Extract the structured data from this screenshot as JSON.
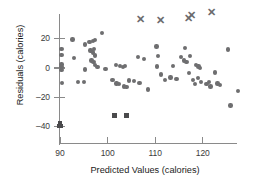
{
  "chart_data": {
    "type": "scatter",
    "title": "",
    "xlabel": "Predicted Values (calories)",
    "ylabel": "Residuals (calories)",
    "xlim": [
      87,
      129
    ],
    "ylim": [
      -44,
      40
    ],
    "xticks": [
      90,
      100,
      110,
      120
    ],
    "xtick_labels": [
      "90",
      "100",
      "110",
      "120"
    ],
    "yticks": [
      20,
      0,
      -20,
      -40
    ],
    "ytick_labels": [
      "20",
      "0",
      "–20",
      "–40"
    ],
    "grid": false,
    "legend": "none",
    "series": [
      {
        "name": "residuals",
        "marker": "circle",
        "color": "#6e6e70",
        "points": [
          [
            90.3,
            13.0
          ],
          [
            90.3,
            9.0
          ],
          [
            90.3,
            2.5
          ],
          [
            90.3,
            0.5
          ],
          [
            90.3,
            -1.5
          ],
          [
            90.4,
            -10.0
          ],
          [
            92.6,
            19.5
          ],
          [
            93.0,
            7.0
          ],
          [
            93.8,
            -9.5
          ],
          [
            95.3,
            16.0
          ],
          [
            96.2,
            17.5
          ],
          [
            96.9,
            18.5
          ],
          [
            97.3,
            19.0
          ],
          [
            96.4,
            12.0
          ],
          [
            96.9,
            10.5
          ],
          [
            97.2,
            13.0
          ],
          [
            97.4,
            8.5
          ],
          [
            96.6,
            5.0
          ],
          [
            97.0,
            4.0
          ],
          [
            97.3,
            2.0
          ],
          [
            97.9,
            0.5
          ],
          [
            98.8,
            24.0
          ],
          [
            95.2,
            -1.0
          ],
          [
            95.0,
            -9.5
          ],
          [
            101.8,
            2.0
          ],
          [
            102.6,
            1.5
          ],
          [
            103.2,
            0.5
          ],
          [
            103.6,
            1.5
          ],
          [
            101.9,
            -10.5
          ],
          [
            102.4,
            -11.0
          ],
          [
            103.4,
            -12.5
          ],
          [
            104.0,
            -13.0
          ],
          [
            104.5,
            -8.5
          ],
          [
            105.6,
            -9.0
          ],
          [
            106.7,
            -10.0
          ],
          [
            106.4,
            7.5
          ],
          [
            107.6,
            6.0
          ],
          [
            108.5,
            -14.5
          ],
          [
            110.3,
            14.5
          ],
          [
            110.6,
            8.0
          ],
          [
            110.4,
            1.0
          ],
          [
            111.2,
            -4.5
          ],
          [
            112.0,
            -8.0
          ],
          [
            113.2,
            -6.5
          ],
          [
            114.5,
            -7.5
          ],
          [
            115.4,
            7.5
          ],
          [
            116.2,
            13.5
          ],
          [
            116.0,
            5.0
          ],
          [
            116.6,
            4.0
          ],
          [
            117.3,
            8.0
          ],
          [
            117.1,
            -3.5
          ],
          [
            118.0,
            -8.0
          ],
          [
            118.3,
            -11.0
          ],
          [
            118.6,
            2.0
          ],
          [
            119.1,
            1.0
          ],
          [
            119.4,
            0.0
          ],
          [
            119.0,
            -7.0
          ],
          [
            119.6,
            -9.5
          ],
          [
            120.8,
            -11.0
          ],
          [
            121.3,
            -9.5
          ],
          [
            121.6,
            -12.5
          ],
          [
            122.6,
            -3.0
          ],
          [
            123.1,
            -10.5
          ],
          [
            123.6,
            -11.5
          ],
          [
            125.3,
            12.5
          ],
          [
            125.8,
            -25.5
          ],
          [
            127.4,
            -15.5
          ],
          [
            99.6,
            -0.5
          ],
          [
            101.0,
            -8.0
          ],
          [
            113.8,
            1.5
          ]
        ]
      },
      {
        "name": "influential-high-outliers",
        "marker": "x",
        "color": "#6b6b6d",
        "points": [
          [
            106.9,
            33.5
          ],
          [
            111.2,
            32.5
          ],
          [
            117.0,
            34.0
          ],
          [
            117.6,
            36.0
          ],
          [
            121.9,
            38.0
          ]
        ]
      },
      {
        "name": "low-outliers",
        "marker": "square",
        "color": "#4a4a4c",
        "points": [
          [
            90.0,
            -37.5
          ],
          [
            90.2,
            -39.5
          ],
          [
            89.9,
            -39.5
          ],
          [
            101.5,
            -32.5
          ],
          [
            104.0,
            -32.5
          ]
        ]
      }
    ]
  },
  "axes": {
    "y_title": "Residuals (calories)",
    "x_title": "Predicted Values (calories)"
  }
}
